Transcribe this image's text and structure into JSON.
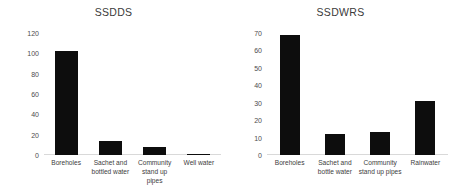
{
  "chart_data": [
    {
      "type": "bar",
      "title": "SSDDS",
      "xlabel": "",
      "ylabel": "",
      "categories": [
        "Boreholes",
        "Sachet and bottled water",
        "Community stand up pipes",
        "Well water"
      ],
      "values": [
        102,
        14,
        8,
        1
      ],
      "yticks": [
        0,
        20,
        40,
        60,
        80,
        100,
        120
      ],
      "ylim": [
        0,
        120
      ],
      "grid": false,
      "legend": "none",
      "bar_color": "#0d0d0d"
    },
    {
      "type": "bar",
      "title": "SSDWRS",
      "xlabel": "",
      "ylabel": "",
      "categories": [
        "Boreholes",
        "Sachet and bottle water",
        "Community stand up pipes",
        "Rainwater"
      ],
      "values": [
        69,
        12,
        13,
        31
      ],
      "yticks": [
        0,
        10,
        20,
        30,
        40,
        50,
        60,
        70
      ],
      "ylim": [
        0,
        70
      ],
      "grid": false,
      "legend": "none",
      "bar_color": "#0d0d0d"
    }
  ]
}
